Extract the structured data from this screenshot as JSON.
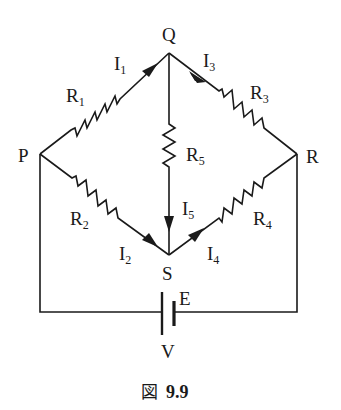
{
  "figure": {
    "caption_prefix": "図",
    "caption_number": "9.9"
  },
  "nodes": {
    "P": "P",
    "Q": "Q",
    "R": "R",
    "S": "S"
  },
  "resistors": {
    "R1": {
      "base": "R",
      "sub": "1"
    },
    "R2": {
      "base": "R",
      "sub": "2"
    },
    "R3": {
      "base": "R",
      "sub": "3"
    },
    "R4": {
      "base": "R",
      "sub": "4"
    },
    "R5": {
      "base": "R",
      "sub": "5"
    }
  },
  "currents": {
    "I1": {
      "base": "I",
      "sub": "1"
    },
    "I2": {
      "base": "I",
      "sub": "2"
    },
    "I3": {
      "base": "I",
      "sub": "3"
    },
    "I4": {
      "base": "I",
      "sub": "4"
    },
    "I5": {
      "base": "I",
      "sub": "5"
    }
  },
  "source": {
    "emf_label": "E",
    "voltage_label": "V"
  }
}
